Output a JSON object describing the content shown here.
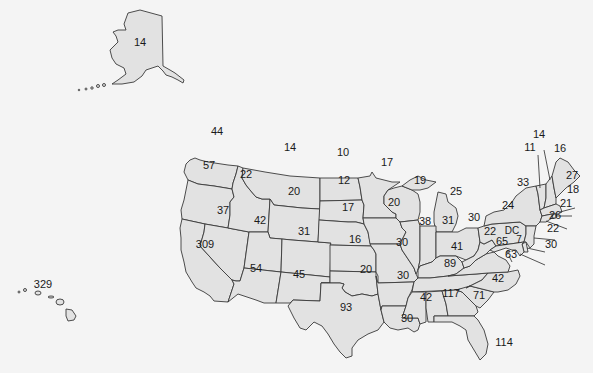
{
  "map": {
    "type": "choropleth-values",
    "region": "United States",
    "fill_color": "#e2e2e2",
    "stroke_color": "#3a3a3a",
    "background_color": "#f4f4f4",
    "states": [
      {
        "id": "AK",
        "name": "Alaska",
        "value": "14"
      },
      {
        "id": "HI",
        "name": "Hawaii",
        "value": "329"
      },
      {
        "id": "WA",
        "name": "Washington",
        "value": "44"
      },
      {
        "id": "OR",
        "name": "Oregon",
        "value": "57"
      },
      {
        "id": "CA",
        "name": "California",
        "value": "309"
      },
      {
        "id": "ID",
        "name": "Idaho",
        "value": "22"
      },
      {
        "id": "NV",
        "name": "Nevada",
        "value": "37"
      },
      {
        "id": "MT",
        "name": "Montana",
        "value": "14"
      },
      {
        "id": "WY",
        "name": "Wyoming",
        "value": "20"
      },
      {
        "id": "UT",
        "name": "Utah",
        "value": "42"
      },
      {
        "id": "AZ",
        "name": "Arizona",
        "value": "54"
      },
      {
        "id": "CO",
        "name": "Colorado",
        "value": "31"
      },
      {
        "id": "NM",
        "name": "New Mexico",
        "value": "45"
      },
      {
        "id": "ND",
        "name": "North Dakota",
        "value": "10"
      },
      {
        "id": "SD",
        "name": "South Dakota",
        "value": "12"
      },
      {
        "id": "NE",
        "name": "Nebraska",
        "value": "17"
      },
      {
        "id": "KS",
        "name": "Kansas",
        "value": "16"
      },
      {
        "id": "OK",
        "name": "Oklahoma",
        "value": "20"
      },
      {
        "id": "TX",
        "name": "Texas",
        "value": "93"
      },
      {
        "id": "MN",
        "name": "Minnesota",
        "value": "17"
      },
      {
        "id": "IA",
        "name": "Iowa",
        "value": "20"
      },
      {
        "id": "MO",
        "name": "Missouri",
        "value": "30"
      },
      {
        "id": "AR",
        "name": "Arkansas",
        "value": "30"
      },
      {
        "id": "LA",
        "name": "Louisiana",
        "value": "30"
      },
      {
        "id": "WI",
        "name": "Wisconsin",
        "value": "19"
      },
      {
        "id": "IL",
        "name": "Illinois",
        "value": "38"
      },
      {
        "id": "MI",
        "name": "Michigan",
        "value": "25"
      },
      {
        "id": "IN",
        "name": "Indiana",
        "value": "31"
      },
      {
        "id": "OH",
        "name": "Ohio",
        "value": "30"
      },
      {
        "id": "KY",
        "name": "Kentucky",
        "value": "41"
      },
      {
        "id": "TN",
        "name": "Tennessee",
        "value": "89"
      },
      {
        "id": "MS",
        "name": "Mississippi",
        "value": "42"
      },
      {
        "id": "AL",
        "name": "Alabama",
        "value": "117"
      },
      {
        "id": "GA",
        "name": "Georgia",
        "value": "71"
      },
      {
        "id": "FL",
        "name": "Florida",
        "value": "114"
      },
      {
        "id": "SC",
        "name": "South Carolina",
        "value": "42"
      },
      {
        "id": "NC",
        "name": "North Carolina",
        "value": "63"
      },
      {
        "id": "VA",
        "name": "Virginia",
        "value": "65"
      },
      {
        "id": "WV",
        "name": "West Virginia",
        "value": "22"
      },
      {
        "id": "PA",
        "name": "Pennsylvania",
        "value": "24"
      },
      {
        "id": "NY",
        "name": "New York",
        "value": "33"
      },
      {
        "id": "VT",
        "name": "Vermont",
        "value": "11"
      },
      {
        "id": "NH",
        "name": "New Hampshire",
        "value": "14"
      },
      {
        "id": "ME",
        "name": "Maine",
        "value": "16"
      },
      {
        "id": "MA",
        "name": "Massachusetts",
        "value": "27"
      },
      {
        "id": "RI",
        "name": "Rhode Island",
        "value": "18"
      },
      {
        "id": "CT",
        "name": "Connecticut",
        "value": "21"
      },
      {
        "id": "NJ",
        "name": "New Jersey",
        "value": "26"
      },
      {
        "id": "DE",
        "name": "Delaware",
        "value": "22"
      },
      {
        "id": "MD",
        "name": "Maryland",
        "value": "30"
      },
      {
        "id": "DC",
        "name": "District of Columbia",
        "value": "7",
        "label": "DC"
      }
    ]
  }
}
